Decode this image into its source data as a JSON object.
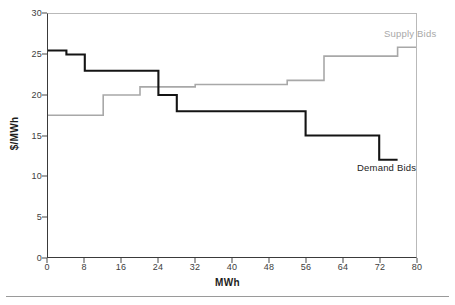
{
  "chart_data": {
    "type": "line",
    "title": "",
    "subtitle": "",
    "xlabel": "MWh",
    "ylabel": "$/MWh",
    "xlim": [
      0,
      80
    ],
    "ylim": [
      0,
      30
    ],
    "xticks": [
      0,
      8,
      16,
      24,
      32,
      40,
      48,
      56,
      64,
      72,
      80
    ],
    "yticks": [
      0,
      5,
      10,
      15,
      20,
      25,
      30
    ],
    "grid": false,
    "legend_position": "inline-annotation",
    "step_style": "post",
    "series": [
      {
        "name": "Supply Bids",
        "color": "#a8a8a8",
        "label_x": 66,
        "label_y": 27.2,
        "points": [
          {
            "x": 0,
            "y": 17.5
          },
          {
            "x": 12,
            "y": 17.5
          },
          {
            "x": 12,
            "y": 20.0
          },
          {
            "x": 20,
            "y": 20.0
          },
          {
            "x": 20,
            "y": 21.0
          },
          {
            "x": 32,
            "y": 21.0
          },
          {
            "x": 32,
            "y": 21.3
          },
          {
            "x": 52,
            "y": 21.3
          },
          {
            "x": 52,
            "y": 21.8
          },
          {
            "x": 60,
            "y": 21.8
          },
          {
            "x": 60,
            "y": 24.8
          },
          {
            "x": 76,
            "y": 24.8
          },
          {
            "x": 76,
            "y": 25.9
          },
          {
            "x": 80,
            "y": 25.9
          }
        ]
      },
      {
        "name": "Demand Bids",
        "color": "#141414",
        "label_x": 61,
        "label_y": 10.0,
        "points": [
          {
            "x": 0,
            "y": 25.5
          },
          {
            "x": 4,
            "y": 25.5
          },
          {
            "x": 4,
            "y": 25.0
          },
          {
            "x": 8,
            "y": 25.0
          },
          {
            "x": 8,
            "y": 23.0
          },
          {
            "x": 24,
            "y": 23.0
          },
          {
            "x": 24,
            "y": 20.0
          },
          {
            "x": 28,
            "y": 20.0
          },
          {
            "x": 28,
            "y": 18.0
          },
          {
            "x": 56,
            "y": 18.0
          },
          {
            "x": 56,
            "y": 15.0
          },
          {
            "x": 72,
            "y": 15.0
          },
          {
            "x": 72,
            "y": 12.0
          },
          {
            "x": 76,
            "y": 12.0
          }
        ]
      }
    ]
  },
  "annotations": {
    "supply_label": "Supply Bids",
    "demand_label": "Demand Bids"
  },
  "axes": {
    "x_title": "MWh",
    "y_title": "$/MWh"
  },
  "colors": {
    "supply": "#a8a8a8",
    "demand": "#141414",
    "axis": "#3a3a3a",
    "frame": "#b9b9b9",
    "tick_text": "#3d3d3d",
    "background": "#ffffff",
    "rule": "#9a9a9a"
  }
}
